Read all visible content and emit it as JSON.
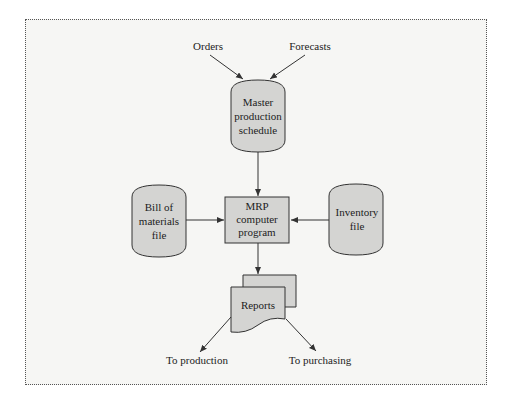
{
  "diagram": {
    "inputs": {
      "orders": "Orders",
      "forecasts": "Forecasts"
    },
    "master_schedule": [
      "Master",
      "production",
      "schedule"
    ],
    "bill_of_materials": [
      "Bill of",
      "materials",
      "file"
    ],
    "mrp_program": [
      "MRP",
      "computer",
      "program"
    ],
    "inventory_file": [
      "Inventory",
      "file"
    ],
    "reports": "Reports",
    "outputs": {
      "production": "To production",
      "purchasing": "To purchasing"
    },
    "colors": {
      "shape_fill": "#d4d4d2",
      "stroke": "#333333",
      "background": "#f6f6f4"
    }
  }
}
